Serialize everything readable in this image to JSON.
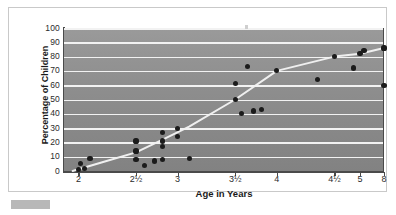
{
  "chart_data": {
    "type": "scatter",
    "title": "",
    "xlabel": "Age in Years",
    "ylabel": "Percentage of Children",
    "ylim": [
      0,
      100
    ],
    "ytick_labels": [
      "100",
      "90",
      "80",
      "70",
      "60",
      "50",
      "40",
      "30",
      "20",
      "10",
      "0"
    ],
    "ytick_values": [
      100,
      90,
      80,
      70,
      60,
      50,
      40,
      30,
      20,
      10,
      0
    ],
    "xtick_labels": [
      "2",
      "2½",
      "3",
      "3½",
      "4",
      "4½",
      "5",
      "8"
    ],
    "xtick_positions": [
      0.045,
      0.225,
      0.355,
      0.535,
      0.665,
      0.845,
      0.925,
      1.0
    ],
    "grid": "horizontal-white",
    "legend": null,
    "background_color": "#8e8e8e",
    "point_color": "#1b1b1b",
    "line_color": "#efefef",
    "frame_color": "#c9c9c9",
    "points": [
      {
        "x": 2.0,
        "y": 1
      },
      {
        "x": 2.02,
        "y": 5
      },
      {
        "x": 2.05,
        "y": 2
      },
      {
        "x": 2.1,
        "y": 9
      },
      {
        "x": 2.5,
        "y": 21
      },
      {
        "x": 2.5,
        "y": 14
      },
      {
        "x": 2.5,
        "y": 8
      },
      {
        "x": 2.6,
        "y": 4
      },
      {
        "x": 2.72,
        "y": 7
      },
      {
        "x": 2.82,
        "y": 27
      },
      {
        "x": 2.82,
        "y": 21
      },
      {
        "x": 2.82,
        "y": 17
      },
      {
        "x": 2.82,
        "y": 8
      },
      {
        "x": 3.0,
        "y": 30
      },
      {
        "x": 3.0,
        "y": 24
      },
      {
        "x": 3.1,
        "y": 9
      },
      {
        "x": 3.5,
        "y": 61
      },
      {
        "x": 3.5,
        "y": 50
      },
      {
        "x": 3.58,
        "y": 40
      },
      {
        "x": 3.65,
        "y": 73
      },
      {
        "x": 3.72,
        "y": 42
      },
      {
        "x": 3.82,
        "y": 43
      },
      {
        "x": 4.0,
        "y": 70
      },
      {
        "x": 4.35,
        "y": 64
      },
      {
        "x": 4.5,
        "y": 80
      },
      {
        "x": 4.88,
        "y": 72
      },
      {
        "x": 5.0,
        "y": 82
      },
      {
        "x": 5.5,
        "y": 84
      },
      {
        "x": 8.0,
        "y": 86
      },
      {
        "x": 8.0,
        "y": 60
      }
    ],
    "trend_line": [
      {
        "x": 1.95,
        "y": 0
      },
      {
        "x": 2.2,
        "y": 6
      },
      {
        "x": 2.5,
        "y": 13
      },
      {
        "x": 2.82,
        "y": 22
      },
      {
        "x": 3.1,
        "y": 31
      },
      {
        "x": 3.5,
        "y": 50
      },
      {
        "x": 4.0,
        "y": 70
      },
      {
        "x": 4.5,
        "y": 80
      },
      {
        "x": 5.0,
        "y": 82
      },
      {
        "x": 8.0,
        "y": 86
      }
    ]
  }
}
